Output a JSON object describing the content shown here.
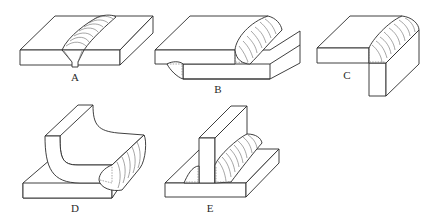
{
  "figure": {
    "panels": [
      {
        "label": "A",
        "joint": "butt-joint"
      },
      {
        "label": "B",
        "joint": "lap-joint"
      },
      {
        "label": "C",
        "joint": "corner-joint"
      },
      {
        "label": "D",
        "joint": "edge-joint"
      },
      {
        "label": "E",
        "joint": "tee-joint"
      }
    ]
  }
}
